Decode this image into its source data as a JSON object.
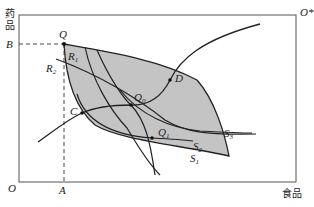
{
  "diagram": {
    "type": "Edgeworth box",
    "origin_a": "O",
    "origin_b": "O*",
    "x_axis_label": "食品",
    "y_axis_label_line1": "药",
    "y_axis_label_line2": "品",
    "tick_x": "A",
    "tick_y": "B",
    "points": {
      "Q": "Q",
      "C": "C",
      "D": "D",
      "Q0": "Q",
      "Q0_sub": "0",
      "Q1": "Q",
      "Q1_sub": "1"
    },
    "curves": {
      "R1": "R",
      "R1_sub": "1",
      "R2": "R",
      "R2_sub": "2",
      "S1": "S",
      "S1_sub": "1",
      "S2": "S",
      "S2_sub": "2",
      "S3": "S",
      "S3_sub": "3"
    },
    "colors": {
      "lens_fill": "#c4c4c4",
      "line": "#222222",
      "box": "#555555"
    }
  }
}
